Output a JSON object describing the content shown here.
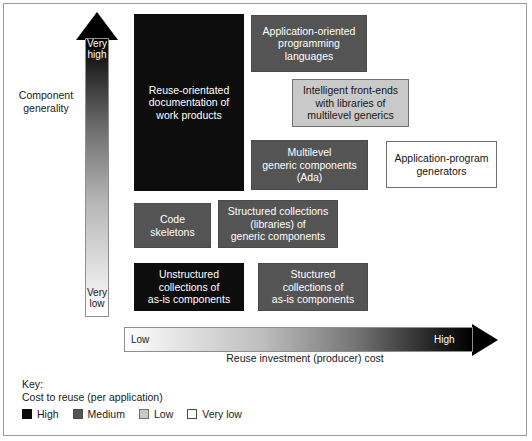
{
  "figure": {
    "y_axis": {
      "title": "Component\ngenerality",
      "high_label": "Very\nhigh",
      "low_label": "Very\nlow"
    },
    "x_axis": {
      "title": "Reuse investment (producer) cost",
      "low_label": "Low",
      "high_label": "High"
    },
    "boxes": [
      {
        "id": "reuse-orientated-documentation",
        "label": "Reuse-orientated\ndocumentation of\nwork products",
        "cost": "high"
      },
      {
        "id": "application-oriented-programming-languages",
        "label": "Application-oriented\nprogramming\nlanguages",
        "cost": "medium"
      },
      {
        "id": "intelligent-front-ends",
        "label": "Intelligent front-ends\nwith libraries of\nmultilevel generics",
        "cost": "low"
      },
      {
        "id": "multilevel-generic-components",
        "label": "Multilevel\ngeneric components\n(Ada)",
        "cost": "medium"
      },
      {
        "id": "application-program-generators",
        "label": "Application-program\ngenerators",
        "cost": "verylow"
      },
      {
        "id": "code-skeletons",
        "label": "Code\nskeletons",
        "cost": "medium"
      },
      {
        "id": "structured-collections-generic",
        "label": "Structured collections\n(libraries) of\ngeneric components",
        "cost": "medium"
      },
      {
        "id": "unstructured-collections-as-is",
        "label": "Unstructured\ncollections of\nas-is components",
        "cost": "high"
      },
      {
        "id": "structured-collections-as-is",
        "label": "Stuctured\ncollections of\nas-is components",
        "cost": "medium"
      }
    ],
    "legend": {
      "title": "Key:",
      "subtitle": "Cost to reuse (per application)",
      "entries": [
        {
          "label": "High",
          "cost": "high",
          "color": "#0d0d0d"
        },
        {
          "label": "Medium",
          "cost": "medium",
          "color": "#545454"
        },
        {
          "label": "Low",
          "cost": "low",
          "color": "#c9c9c9"
        },
        {
          "label": "Very low",
          "cost": "verylow",
          "color": "#ffffff"
        }
      ]
    }
  }
}
